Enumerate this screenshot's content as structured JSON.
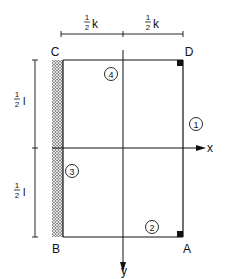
{
  "diagram": {
    "corners": {
      "C": "C",
      "D": "D",
      "B": "B",
      "A": "A"
    },
    "axes": {
      "x": "x",
      "y": "y"
    },
    "dimensions": {
      "top_left": {
        "num": "1",
        "den": "2",
        "var": "k"
      },
      "top_right": {
        "num": "1",
        "den": "2",
        "var": "k"
      },
      "left_top": {
        "num": "1",
        "den": "2",
        "var": "l"
      },
      "left_bottom": {
        "num": "1",
        "den": "2",
        "var": "l"
      }
    },
    "edges": {
      "edge1": "1",
      "edge2": "2",
      "edge3": "3",
      "edge4": "4"
    },
    "colors": {
      "line": "#111111",
      "background": "#ffffff"
    }
  }
}
